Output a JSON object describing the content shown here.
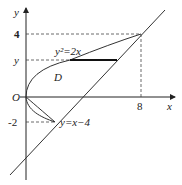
{
  "axes": {
    "x_label": "x",
    "y_label": "y",
    "origin_label": "O"
  },
  "ticks": {
    "y4": "4",
    "yv": "y",
    "ym2": "-2",
    "x8": "8"
  },
  "curves": {
    "parabola": "y²=2x",
    "line": "y=x−4"
  },
  "region_label": "D",
  "colors": {
    "stroke": "#333333",
    "dash": "#444444"
  }
}
